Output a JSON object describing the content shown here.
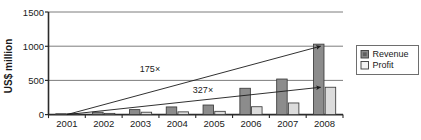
{
  "chart_data": {
    "type": "bar",
    "title": "",
    "subtitle": "",
    "xlabel": "",
    "ylabel": "US$ million",
    "ylim": [
      0,
      1500
    ],
    "yticks": [
      0,
      500,
      1000,
      1500
    ],
    "ytick_labels": [
      "0",
      "500",
      "1000",
      "1500"
    ],
    "grid": true,
    "grid_axis": "y",
    "legend_position": "right",
    "categories": [
      "2001",
      "2002",
      "2003",
      "2004",
      "2005",
      "2006",
      "2007",
      "2008"
    ],
    "series": [
      {
        "name": "Revenue",
        "color": "#8c8c8c",
        "values": [
          6,
          35,
          73,
          112,
          140,
          385,
          520,
          1030
        ]
      },
      {
        "name": "Profit",
        "color": "#dcdcdc",
        "values": [
          2,
          18,
          35,
          40,
          48,
          115,
          170,
          400
        ]
      }
    ],
    "annotations": [
      {
        "label": "175×",
        "series": "Revenue",
        "from": {
          "x": "2001",
          "y": 0
        },
        "to": {
          "x": "2008",
          "y": 1000
        },
        "label_x": 150,
        "label_y": 72
      },
      {
        "label": "327×",
        "series": "Profit",
        "from": {
          "x": "2001",
          "y": 0
        },
        "to": {
          "x": "2008",
          "y": 400
        },
        "label_x": 203,
        "label_y": 93
      }
    ]
  },
  "legend": {
    "items": [
      {
        "label": "Revenue",
        "swatch": "#8c8c8c"
      },
      {
        "label": "Profit",
        "swatch": "#dcdcdc"
      }
    ]
  },
  "colors": {
    "revenue": "#8c8c8c",
    "profit": "#dcdcdc",
    "axis": "#2b2b2b",
    "grid": "#6e6e6e",
    "background": "#ffffff",
    "bar_border": "#3a3a3a"
  }
}
